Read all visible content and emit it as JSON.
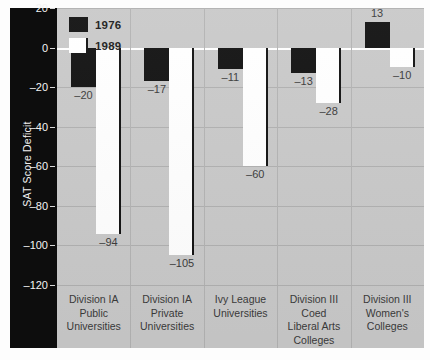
{
  "chart_data": {
    "type": "bar",
    "title": "",
    "xlabel": "",
    "ylabel": "SAT Score Deficit",
    "ylim": [
      -120,
      20
    ],
    "yticks": [
      20,
      0,
      -20,
      -40,
      -60,
      -80,
      -100,
      -120
    ],
    "ytick_labels": [
      "20",
      "0",
      "–20",
      "–40",
      "–60",
      "–80",
      "–100",
      "–120"
    ],
    "grid": true,
    "legend_position": "top-left",
    "categories": [
      "Division IA Public Universities",
      "Division IA Private Universities",
      "Ivy League Universities",
      "Division III Coed Liberal Arts Colleges",
      "Division III Women's Colleges"
    ],
    "category_label_lines": [
      [
        "Division IA",
        "Public",
        "Universities"
      ],
      [
        "Division IA",
        "Private",
        "Universities"
      ],
      [
        "Ivy League",
        "Universities"
      ],
      [
        "Division III",
        "Coed",
        "Liberal Arts",
        "Colleges"
      ],
      [
        "Division III",
        "Women's",
        "Colleges"
      ]
    ],
    "series": [
      {
        "name": "1976",
        "color": "#111111",
        "values": [
          -20,
          -17,
          -11,
          -13,
          13
        ],
        "value_labels": [
          "–20",
          "–17",
          "–11",
          "–13",
          "13"
        ]
      },
      {
        "name": "1989",
        "color": "#ffffff",
        "values": [
          -94,
          -105,
          -60,
          -28,
          -10
        ],
        "value_labels": [
          "–94",
          "–105",
          "–60",
          "–28",
          "–10"
        ]
      }
    ]
  },
  "legend": {
    "items": [
      {
        "label": "1976",
        "swatch": "black-filled-swatch"
      },
      {
        "label": "1989",
        "swatch": "white-filled-swatch"
      }
    ]
  },
  "axis": {
    "y_title": "SAT Score Deficit"
  },
  "colors": {
    "panel_background": "#c9c9c9",
    "axis_strip_background": "#0d0d0d",
    "series_1976": "#111111",
    "series_1989": "#ffffff",
    "gridline": "#b0b0b0",
    "zeroline": "#ffffff",
    "tick_text": "#f4f4f4",
    "label_text": "#3a3a3a"
  }
}
